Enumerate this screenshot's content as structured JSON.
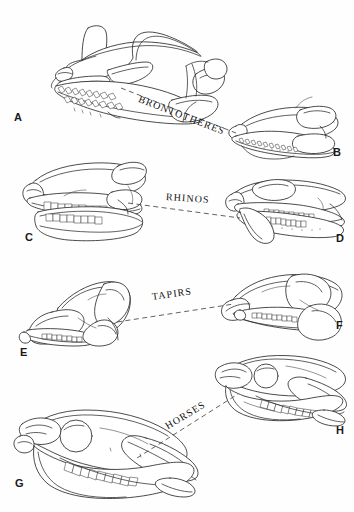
{
  "figure": {
    "title": "",
    "background_color": "#fefefe",
    "ink_color": "#2b2b2b",
    "width": 354,
    "height": 512
  },
  "groups": [
    {
      "id": "brontotheres",
      "label": "BRONTOTHERES",
      "label_rotation_deg": 21,
      "label_x": 139,
      "label_y": 99,
      "connector": {
        "x1": 121,
        "y1": 88,
        "x2": 235,
        "y2": 132
      }
    },
    {
      "id": "rhinos",
      "label": "RHINOS",
      "label_rotation_deg": 4,
      "label_x": 166,
      "label_y": 197,
      "connector": {
        "x1": 128,
        "y1": 203,
        "x2": 240,
        "y2": 218
      }
    },
    {
      "id": "tapirs",
      "label": "TAPIRS",
      "label_rotation_deg": -8,
      "label_x": 152,
      "label_y": 297,
      "connector": {
        "x1": 117,
        "y1": 322,
        "x2": 234,
        "y2": 304
      }
    },
    {
      "id": "horses",
      "label": "HORSES",
      "label_rotation_deg": -31,
      "label_x": 166,
      "label_y": 427,
      "connector": {
        "x1": 137,
        "y1": 458,
        "x2": 238,
        "y2": 394
      }
    }
  ],
  "specimens": [
    {
      "letter": "A",
      "group": "brontotheres",
      "position": "left",
      "letter_x": 14,
      "letter_y": 111
    },
    {
      "letter": "B",
      "group": "brontotheres",
      "position": "right",
      "letter_x": 333,
      "letter_y": 146
    },
    {
      "letter": "C",
      "group": "rhinos",
      "position": "left",
      "letter_x": 25,
      "letter_y": 231
    },
    {
      "letter": "D",
      "group": "rhinos",
      "position": "right",
      "letter_x": 336,
      "letter_y": 232
    },
    {
      "letter": "E",
      "group": "tapirs",
      "position": "left",
      "letter_x": 20,
      "letter_y": 346
    },
    {
      "letter": "F",
      "group": "tapirs",
      "position": "right",
      "letter_x": 336,
      "letter_y": 319
    },
    {
      "letter": "G",
      "group": "horses",
      "position": "left",
      "letter_x": 15,
      "letter_y": 477
    },
    {
      "letter": "H",
      "group": "horses",
      "position": "right",
      "letter_x": 336,
      "letter_y": 424
    }
  ]
}
